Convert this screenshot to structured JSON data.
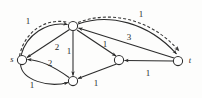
{
  "figure": {
    "kind": "directed-flow-network-diagram",
    "width": 202,
    "height": 98,
    "background_color": "#fdfdfc",
    "stroke_color": "#2b2b2b",
    "dashed_path_color": "#3a3a3a"
  },
  "nodes": [
    {
      "id": "s",
      "label": "s",
      "x": 22,
      "y": 60,
      "r": 4.6,
      "label_x": 12,
      "label_y": 59
    },
    {
      "id": "v1",
      "label": "",
      "x": 73,
      "y": 26,
      "r": 4.6,
      "label_x": 73,
      "label_y": 26
    },
    {
      "id": "v2",
      "label": "",
      "x": 73,
      "y": 81,
      "r": 4.6,
      "label_x": 73,
      "label_y": 81
    },
    {
      "id": "v3",
      "label": "",
      "x": 119,
      "y": 60,
      "r": 4.6,
      "label_x": 119,
      "label_y": 60
    },
    {
      "id": "t",
      "label": "t",
      "x": 178,
      "y": 61,
      "r": 4.6,
      "label_x": 190,
      "label_y": 60
    }
  ],
  "edges": [
    {
      "id": "s-v1",
      "from": "s",
      "to": "v1",
      "weight": "1",
      "label_x": 28,
      "label_y": 21,
      "style": "solid",
      "shape": "curve-up"
    },
    {
      "id": "v1-t",
      "from": "v1",
      "to": "t",
      "weight": "1",
      "label_x": 141,
      "label_y": 14,
      "style": "solid",
      "shape": "curve-up"
    },
    {
      "id": "v1-s",
      "from": "v1",
      "to": "s",
      "weight": "2",
      "label_x": 57,
      "label_y": 47,
      "style": "solid",
      "shape": "straight"
    },
    {
      "id": "v1-v2",
      "from": "v1",
      "to": "v2",
      "weight": "1",
      "label_x": 69,
      "label_y": 51,
      "style": "solid",
      "shape": "straight"
    },
    {
      "id": "v1-v3",
      "from": "v1",
      "to": "v3",
      "weight": "1",
      "label_x": 105,
      "label_y": 44,
      "style": "solid",
      "shape": "straight"
    },
    {
      "id": "t-v1",
      "from": "t",
      "to": "v1",
      "weight": "3",
      "label_x": 129,
      "label_y": 37,
      "style": "solid",
      "shape": "straight"
    },
    {
      "id": "v2-s",
      "from": "v2",
      "to": "s",
      "weight": "2",
      "label_x": 50,
      "label_y": 63,
      "style": "solid",
      "shape": "curve-upper"
    },
    {
      "id": "s-v2",
      "from": "s",
      "to": "v2",
      "weight": "1",
      "label_x": 32,
      "label_y": 85,
      "style": "solid",
      "shape": "curve-lower"
    },
    {
      "id": "v2-v3",
      "from": "v2",
      "to": "v3",
      "weight": "1",
      "label_x": 96,
      "label_y": 83,
      "style": "solid",
      "shape": "straight"
    },
    {
      "id": "t-v3",
      "from": "t",
      "to": "v3",
      "weight": "1",
      "label_x": 148,
      "label_y": 73,
      "style": "solid",
      "shape": "straight"
    }
  ],
  "augmenting_path": {
    "id": "dashed-augmenting-path",
    "style": "dashed",
    "route": [
      "s",
      "v1",
      "t"
    ],
    "description": "dashed highlighted path from s through top node to t"
  }
}
